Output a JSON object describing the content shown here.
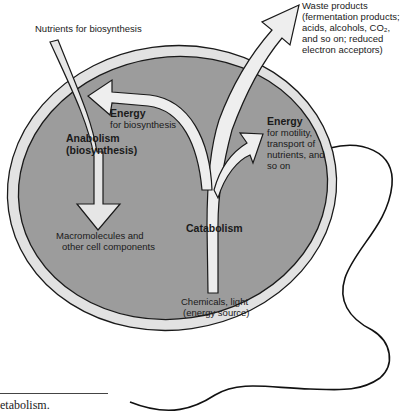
{
  "diagram": {
    "colors": {
      "cell_fill": "#9c9c9c",
      "membrane": "#e2e2e2",
      "arrow_fill": "#ededed",
      "outline": "#1a1a1a",
      "flagellum": "#111111"
    },
    "labels": {
      "nutrients": "Nutrients for biosynthesis",
      "waste_lines": [
        "Waste products",
        "(fermentation products;",
        "acids, alcohols, CO₂,",
        "and so on; reduced",
        "electron acceptors)"
      ],
      "energy_biosynthesis_title": "Energy",
      "energy_biosynthesis_sub": "for biosynthesis",
      "anabolism_line1": "Anabolism",
      "anabolism_line2": "(biosynthesis)",
      "energy_motility_title": "Energy",
      "energy_motility_lines": [
        "for motility,",
        "transport of",
        "nutrients, and",
        "so on"
      ],
      "macromolecules_line1": "Macromolecules and",
      "macromolecules_line2": "other cell components",
      "catabolism": "Catabolism",
      "chemicals_line1": "Chemicals, light",
      "chemicals_line2": "(energy source)"
    },
    "caption_fragment": "etabolism."
  }
}
